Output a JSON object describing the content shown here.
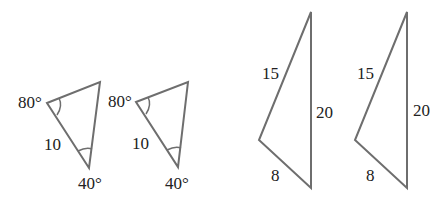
{
  "figure": {
    "stroke_color": "#6e6e6e",
    "text_color": "#222222",
    "triangles": [
      {
        "id": "asa-1",
        "labels": {
          "angle_top": "80°",
          "side": "10",
          "angle_bottom": "40°"
        }
      },
      {
        "id": "asa-2",
        "labels": {
          "angle_top": "80°",
          "side": "10",
          "angle_bottom": "40°"
        }
      },
      {
        "id": "sss-1",
        "labels": {
          "side_left": "15",
          "side_right": "20",
          "side_bottom": "8"
        }
      },
      {
        "id": "sss-2",
        "labels": {
          "side_left": "15",
          "side_right": "20",
          "side_bottom": "8"
        }
      }
    ]
  }
}
